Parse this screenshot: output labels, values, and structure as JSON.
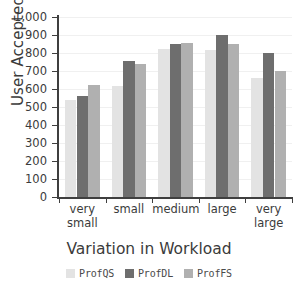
{
  "chart_data": {
    "type": "bar",
    "title": "",
    "xlabel": "Variation in Workload",
    "ylabel": "User Accepted",
    "categories": [
      "very small",
      "small",
      "medium",
      "large",
      "very large"
    ],
    "category_lines": [
      [
        "very",
        "small"
      ],
      [
        "small"
      ],
      [
        "medium"
      ],
      [
        "large"
      ],
      [
        "very",
        "large"
      ]
    ],
    "series": [
      {
        "name": "ProfQS",
        "color": "#e3e3e3",
        "values": [
          540,
          618,
          820,
          818,
          660
        ]
      },
      {
        "name": "ProfDL",
        "color": "#6e6e6e",
        "values": [
          562,
          755,
          850,
          898,
          800
        ]
      },
      {
        "name": "ProfFS",
        "color": "#b0b0b0",
        "values": [
          625,
          738,
          858,
          848,
          698
        ]
      }
    ],
    "ylim": [
      0,
      1000
    ],
    "yticks": [
      0,
      100,
      200,
      300,
      400,
      500,
      600,
      700,
      800,
      900,
      1000
    ],
    "ytick_labels": [
      "0",
      "100",
      "200",
      "300",
      "400",
      "500",
      "600",
      "700",
      "800",
      "900",
      "1,000"
    ],
    "grid": true,
    "grid_axis": "y",
    "legend_position": "bottom",
    "axis_color": "#3f3f3f",
    "grid_color": "#f0f0f0",
    "text_color": "#3b3b3b"
  }
}
